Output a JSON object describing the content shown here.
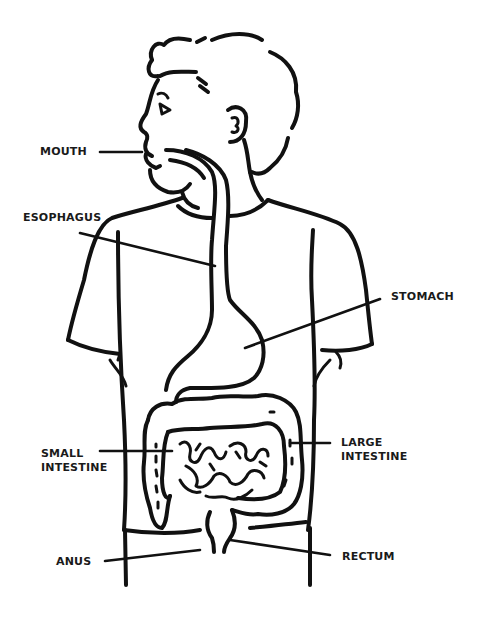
{
  "diagram": {
    "colors": {
      "line": "#111111",
      "background": "#ffffff",
      "text": "#1a1a1a"
    },
    "labels": {
      "mouth": {
        "lines": [
          "MOUTH"
        ]
      },
      "esophagus": {
        "lines": [
          "ESOPHAGUS"
        ]
      },
      "stomach": {
        "lines": [
          "STOMACH"
        ]
      },
      "small_intestine": {
        "lines": [
          "SMALL",
          "INTESTINE"
        ]
      },
      "large_intestine": {
        "lines": [
          "LARGE",
          "INTESTINE"
        ]
      },
      "anus": {
        "lines": [
          "ANUS"
        ]
      },
      "rectum": {
        "lines": [
          "RECTUM"
        ]
      }
    }
  }
}
